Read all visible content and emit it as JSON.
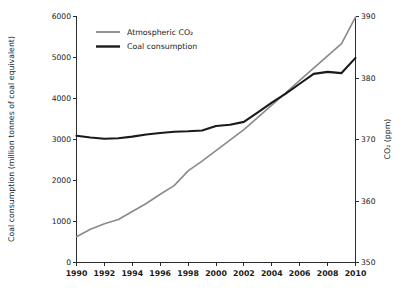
{
  "chart_data": {
    "type": "line",
    "title": "",
    "subtitle": "",
    "xlabel": "",
    "ylabel": "Coal consumption (million tonnes of coal equivalent)",
    "y2label": "CO₂ (ppm)",
    "grid": false,
    "legend_position": "top-left",
    "x": [
      1990,
      1991,
      1992,
      1993,
      1994,
      1995,
      1996,
      1997,
      1998,
      1999,
      2000,
      2001,
      2002,
      2003,
      2004,
      2005,
      2006,
      2007,
      2008,
      2009,
      2010
    ],
    "xlim": [
      1990,
      2010
    ],
    "xticks": [
      1990,
      1992,
      1994,
      1996,
      1998,
      2000,
      2002,
      2004,
      2006,
      2008,
      2010
    ],
    "xticklabels": [
      "1990",
      "1992",
      "1994",
      "1996",
      "1998",
      "2000",
      "2002",
      "2004",
      "2006",
      "2008",
      "2010"
    ],
    "ylim": [
      0,
      6000
    ],
    "yticks": [
      0,
      1000,
      2000,
      3000,
      4000,
      5000,
      6000
    ],
    "yticklabels": [
      "0",
      "1000",
      "2000",
      "3000",
      "4000",
      "5000",
      "6000"
    ],
    "y2lim": [
      350,
      390
    ],
    "y2ticks": [
      350,
      360,
      370,
      380,
      390
    ],
    "y2ticklabels": [
      "350",
      "360",
      "370",
      "380",
      "390"
    ],
    "series": [
      {
        "name": "Atmospheric CO₂",
        "axis": "right",
        "color": "#8a8a8a",
        "units": "ppm",
        "values": [
          354.2,
          355.4,
          356.3,
          357.0,
          358.3,
          359.6,
          361.1,
          362.5,
          364.9,
          366.5,
          368.2,
          369.9,
          371.6,
          373.6,
          375.6,
          377.6,
          379.6,
          381.6,
          383.6,
          385.6,
          389.9
        ]
      },
      {
        "name": "Coal consumption",
        "axis": "left",
        "color": "#1a1a1a",
        "units": "million tonnes of coal equivalent",
        "values": [
          3090,
          3050,
          3020,
          3030,
          3070,
          3120,
          3160,
          3190,
          3200,
          3220,
          3330,
          3360,
          3430,
          3660,
          3900,
          4120,
          4360,
          4600,
          4650,
          4620,
          4990
        ]
      }
    ],
    "annotations": [],
    "legend": [
      {
        "label": "Atmospheric CO₂",
        "color": "#8a8a8a"
      },
      {
        "label": "Coal consumption",
        "color": "#1a1a1a"
      }
    ]
  },
  "colors": {
    "background": "#ffffff",
    "axis": "#2b2b2b",
    "text": "#1a1a1a",
    "co2_line": "#8a8a8a",
    "coal_line": "#1a1a1a"
  }
}
